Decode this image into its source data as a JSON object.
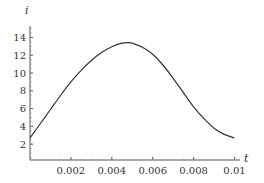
{
  "chart_data": {
    "type": "line",
    "title": "",
    "xlabel": "t",
    "ylabel": "i",
    "xlim": [
      0,
      0.0103
    ],
    "ylim": [
      0,
      15.2
    ],
    "grid": false,
    "legend": null,
    "x_ticks": [
      0.002,
      0.004,
      0.006,
      0.008,
      0.01
    ],
    "x_tick_labels": [
      "0.002",
      "0.004",
      "0.006",
      "0.008",
      "0.01"
    ],
    "y_ticks": [
      2,
      4,
      6,
      8,
      10,
      12,
      14
    ],
    "y_tick_labels": [
      "2",
      "4",
      "6",
      "8",
      "10",
      "12",
      "14"
    ],
    "series": [
      {
        "name": "i(t)",
        "color": "#333333",
        "x": [
          0,
          0.0005,
          0.001,
          0.0015,
          0.002,
          0.0025,
          0.003,
          0.0035,
          0.004,
          0.0045,
          0.0048,
          0.005,
          0.0055,
          0.006,
          0.0065,
          0.007,
          0.0075,
          0.008,
          0.0085,
          0.009,
          0.0095,
          0.01
        ],
        "values": [
          2.7,
          4.3,
          5.9,
          7.5,
          9.0,
          10.3,
          11.4,
          12.3,
          12.95,
          13.35,
          13.42,
          13.35,
          12.9,
          12.1,
          10.9,
          9.4,
          7.8,
          6.2,
          4.9,
          3.8,
          3.1,
          2.7
        ]
      }
    ]
  },
  "axes": {
    "x_label": "t",
    "y_label": "i"
  }
}
